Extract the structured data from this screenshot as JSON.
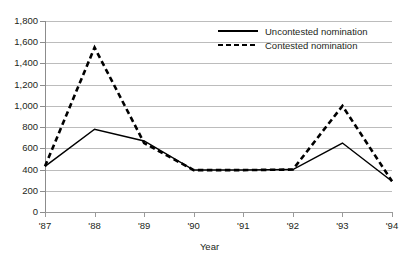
{
  "chart_data": {
    "type": "line",
    "title": "",
    "xlabel": "Year",
    "ylabel": "",
    "categories": [
      "'87",
      "'88",
      "'89",
      "'90",
      "'91",
      "'92",
      "'93",
      "'94"
    ],
    "series": [
      {
        "name": "Uncontested nomination",
        "style": "solid",
        "color": "#000000",
        "values": [
          430,
          780,
          670,
          395,
          395,
          400,
          650,
          290
        ]
      },
      {
        "name": "Contested nomination",
        "style": "dashed",
        "color": "#000000",
        "values": [
          430,
          1550,
          650,
          395,
          395,
          400,
          1000,
          290
        ]
      }
    ],
    "ylim": [
      0,
      1800
    ],
    "ytick_step": 200,
    "ytick_labels": [
      "1,800",
      "1,600",
      "1,400",
      "1,200",
      "1,000",
      "800",
      "600",
      "400",
      "200",
      "0"
    ],
    "grid": true,
    "grid_color": "#bcbcbc",
    "legend_position": "top-right"
  },
  "legend": {
    "entries": [
      {
        "label": "Uncontested nomination",
        "style": "solid"
      },
      {
        "label": "Contested nomination",
        "style": "dashed"
      }
    ]
  },
  "axis": {
    "x_title": "Year"
  }
}
